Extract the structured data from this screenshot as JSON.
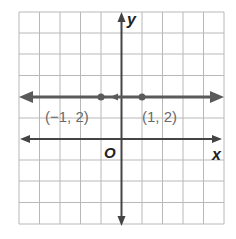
{
  "diagram": {
    "type": "coordinate-plane",
    "grid": {
      "columns": 10,
      "rows": 10,
      "x_range": [
        -5,
        5
      ],
      "y_range": [
        -5,
        5
      ],
      "unit": 1
    },
    "axes": {
      "x_label": "x",
      "y_label": "y",
      "origin_label": "O"
    },
    "line": {
      "equation": "y = 2",
      "arrows": "both",
      "color": "#5a5a5a"
    },
    "points": [
      {
        "x": -1,
        "y": 2,
        "label": "(−1, 2)"
      },
      {
        "x": 1,
        "y": 2,
        "label": "(1, 2)"
      }
    ],
    "colors": {
      "grid": "#b8b8b8",
      "axis": "#444444",
      "line": "#5a5a5a",
      "label": "#6a6a6a"
    }
  }
}
